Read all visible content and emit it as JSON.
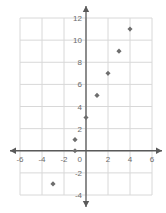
{
  "chart_data": {
    "type": "scatter",
    "title": "",
    "xlabel": "",
    "ylabel": "",
    "xlim": [
      -6,
      6
    ],
    "ylim": [
      -4,
      12
    ],
    "grid": true,
    "legend": null,
    "x_ticks": [
      -6,
      -4,
      -2,
      2,
      4,
      6
    ],
    "y_ticks": [
      12,
      10,
      8,
      6,
      4,
      2,
      -2,
      -4
    ],
    "origin_label": "0",
    "x_tick_labels": [
      "-6",
      "-4",
      "-2",
      "2",
      "4",
      "6"
    ],
    "y_tick_labels": [
      "12",
      "10",
      "8",
      "6",
      "4",
      "2",
      "-2",
      "-4"
    ],
    "points": [
      {
        "x": -3,
        "y": -3
      },
      {
        "x": -1,
        "y": 0
      },
      {
        "x": -1,
        "y": 1
      },
      {
        "x": 0,
        "y": 3
      },
      {
        "x": 1,
        "y": 5
      },
      {
        "x": 2,
        "y": 7
      },
      {
        "x": 3,
        "y": 9
      },
      {
        "x": 4,
        "y": 11
      }
    ],
    "marker_color": "#6e6e6e",
    "grid_color": "#d8d8d8",
    "axis_color": "#5a5a5a",
    "background_color": "#ffffff"
  }
}
